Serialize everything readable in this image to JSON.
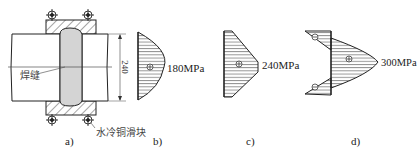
{
  "figure": {
    "panels": [
      {
        "id": "a",
        "label": "a)",
        "content": "weld joint with water-cooled copper sliding blocks"
      },
      {
        "id": "b",
        "label": "b)",
        "stress_label": "180MPa"
      },
      {
        "id": "c",
        "label": "c)",
        "stress_label": "240MPa"
      },
      {
        "id": "d",
        "label": "d)",
        "stress_label": "300MPa"
      }
    ],
    "annotations": {
      "weld": "焊缝",
      "copper_block": "水冷铜滑块",
      "dimension": "240"
    },
    "signs": {
      "tension": "⊕",
      "compression": "⊖"
    },
    "colors": {
      "line": "#222222",
      "weld_fill": "#d4d4d4",
      "background": "#ffffff"
    }
  }
}
